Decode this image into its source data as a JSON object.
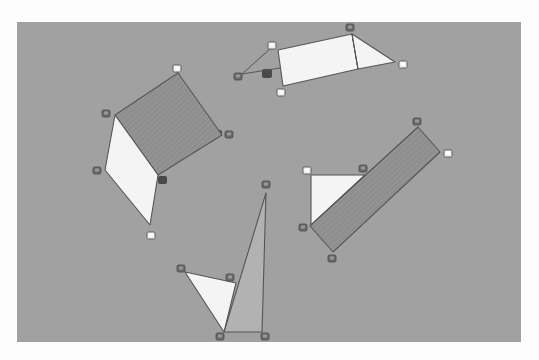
{
  "image": {
    "width": 539,
    "height": 360,
    "page_background": "#fdfdfd",
    "surface": {
      "x": 17,
      "y": 22,
      "width": 504,
      "height": 320,
      "color": "#a1a1a1"
    }
  },
  "colors": {
    "white_paper": "#f4f4f4",
    "dark_paper": "#8e8e8e",
    "mid_paper": "#b2b2b2",
    "edge": "#555555",
    "cube_light": "#ededed",
    "cube_dark": "#6a6a6a",
    "shadow": "#3a3a3a"
  },
  "shapes": [
    {
      "name": "top-group-white-trapezoid",
      "fill": "white_paper",
      "points": "278,50 352,34 358,69 283,86"
    },
    {
      "name": "top-group-white-triangle",
      "fill": "white_paper",
      "points": "352,34 395,62 358,69"
    },
    {
      "name": "left-group-dark-square",
      "fill": "dark_paper",
      "points": "178,73 222,135 158,175 115,115"
    },
    {
      "name": "left-group-white-rhombus",
      "fill": "white_paper",
      "points": "115,115 158,175 150,225 105,170"
    },
    {
      "name": "right-group-white-triangle",
      "fill": "white_paper",
      "points": "311,175 365,175 311,225"
    },
    {
      "name": "right-group-dark-rectangle",
      "fill": "dark_paper",
      "points": "418,127 440,152 333,252 310,226"
    },
    {
      "name": "bottom-group-tall-triangle",
      "fill": "mid_paper",
      "points": "266,193 262,332 224,332"
    },
    {
      "name": "bottom-group-white-triangle",
      "fill": "white_paper",
      "points": "185,272 236,283 224,332"
    }
  ],
  "lines": [
    {
      "name": "top-group-string-upper",
      "x1": 272,
      "y1": 47,
      "x2": 242,
      "y2": 74
    },
    {
      "name": "top-group-string-lower",
      "x1": 242,
      "y1": 74,
      "x2": 280,
      "y2": 68
    },
    {
      "name": "top-group-fold-line",
      "x1": 352,
      "y1": 34,
      "x2": 358,
      "y2": 69
    }
  ],
  "shadows": [
    {
      "name": "top-group-shadow",
      "x": 262,
      "y": 69,
      "w": 10,
      "h": 9
    },
    {
      "name": "left-group-shadow",
      "x": 158,
      "y": 176,
      "w": 9,
      "h": 8
    },
    {
      "name": "left-group-corner-shadow",
      "x": 216,
      "y": 130,
      "w": 6,
      "h": 6
    }
  ],
  "cubes": [
    {
      "name": "cube-top-1",
      "x": 350,
      "y": 27,
      "tone": "cube_dark"
    },
    {
      "name": "cube-top-2",
      "x": 272,
      "y": 45,
      "tone": "cube_light"
    },
    {
      "name": "cube-top-3",
      "x": 238,
      "y": 76,
      "tone": "cube_dark"
    },
    {
      "name": "cube-top-4",
      "x": 281,
      "y": 92,
      "tone": "cube_light"
    },
    {
      "name": "cube-top-5",
      "x": 403,
      "y": 64,
      "tone": "cube_light"
    },
    {
      "name": "cube-left-1",
      "x": 177,
      "y": 68,
      "tone": "cube_light"
    },
    {
      "name": "cube-left-2",
      "x": 106,
      "y": 113,
      "tone": "cube_dark"
    },
    {
      "name": "cube-left-3",
      "x": 229,
      "y": 134,
      "tone": "cube_dark"
    },
    {
      "name": "cube-left-4",
      "x": 97,
      "y": 170,
      "tone": "cube_dark"
    },
    {
      "name": "cube-left-5",
      "x": 151,
      "y": 235,
      "tone": "cube_light"
    },
    {
      "name": "cube-right-1",
      "x": 417,
      "y": 121,
      "tone": "cube_dark"
    },
    {
      "name": "cube-right-2",
      "x": 448,
      "y": 153,
      "tone": "cube_light"
    },
    {
      "name": "cube-right-3",
      "x": 307,
      "y": 170,
      "tone": "cube_light"
    },
    {
      "name": "cube-right-4",
      "x": 363,
      "y": 168,
      "tone": "cube_dark"
    },
    {
      "name": "cube-right-5",
      "x": 303,
      "y": 227,
      "tone": "cube_dark"
    },
    {
      "name": "cube-right-6",
      "x": 332,
      "y": 258,
      "tone": "cube_dark"
    },
    {
      "name": "cube-bottom-1",
      "x": 266,
      "y": 184,
      "tone": "cube_dark"
    },
    {
      "name": "cube-bottom-2",
      "x": 181,
      "y": 268,
      "tone": "cube_dark"
    },
    {
      "name": "cube-bottom-3",
      "x": 230,
      "y": 277,
      "tone": "cube_dark"
    },
    {
      "name": "cube-bottom-4",
      "x": 220,
      "y": 336,
      "tone": "cube_dark"
    },
    {
      "name": "cube-bottom-5",
      "x": 265,
      "y": 336,
      "tone": "cube_dark"
    }
  ]
}
